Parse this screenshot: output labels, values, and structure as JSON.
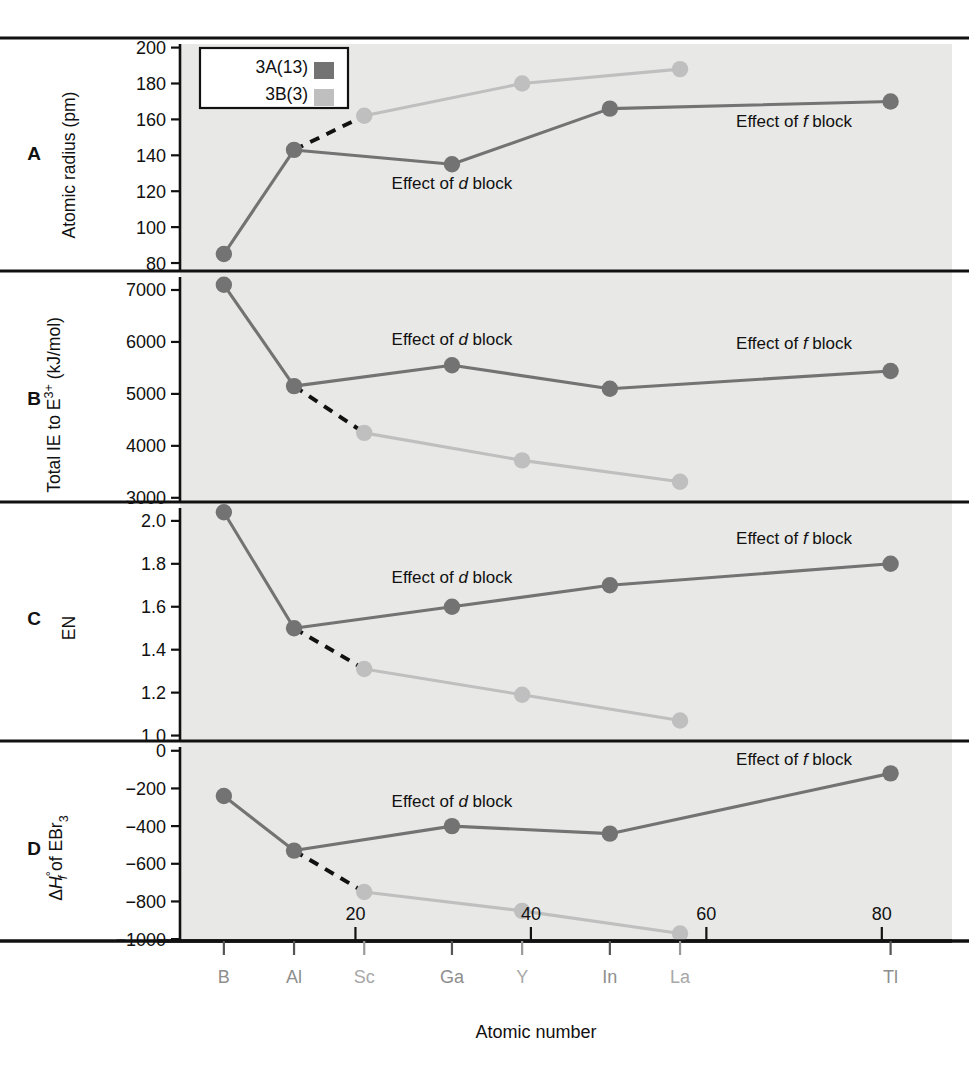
{
  "figure": {
    "xlabel": "Atomic number",
    "legend": {
      "entries": [
        {
          "label": "3A(13)",
          "color": "#737373"
        },
        {
          "label": "3B(3)",
          "color": "#bfbfbf"
        }
      ]
    },
    "element_labels": [
      {
        "symbol": "B",
        "z": 5,
        "group": "3A(13)"
      },
      {
        "symbol": "Al",
        "z": 13,
        "group": "3A(13)"
      },
      {
        "symbol": "Sc",
        "z": 21,
        "group": "3B(3)"
      },
      {
        "symbol": "Ga",
        "z": 31,
        "group": "3A(13)"
      },
      {
        "symbol": "Y",
        "z": 39,
        "group": "3B(3)"
      },
      {
        "symbol": "In",
        "z": 49,
        "group": "3A(13)"
      },
      {
        "symbol": "La",
        "z": 57,
        "group": "3B(3)"
      },
      {
        "symbol": "Tl",
        "z": 81,
        "group": "3A(13)"
      }
    ],
    "x_ticks": [
      20,
      40,
      60,
      80
    ],
    "annotations": {
      "d_block": "Effect of d block",
      "f_block": "Effect of f block",
      "effect_of": "Effect of ",
      "block": " block",
      "d": "d",
      "f": "f"
    },
    "colors": {
      "series_3A": "#737373",
      "series_3B": "#bfbfbf",
      "bridge_dashed": "#111111",
      "plot_background": "#e8e8e6",
      "axis": "#111111"
    }
  },
  "chart_data": [
    {
      "type": "line",
      "panel": "A",
      "title": "",
      "ylabel": "Atomic radius (pm)",
      "xlabel": "Atomic number",
      "ylim": [
        75,
        202
      ],
      "yticks": [
        80,
        100,
        120,
        140,
        160,
        180,
        200
      ],
      "ytick_labels": [
        "80",
        "100",
        "120",
        "140",
        "160",
        "180",
        "200"
      ],
      "xlim": [
        0,
        88
      ],
      "grid": false,
      "legend_position": "top-left",
      "series": [
        {
          "name": "3A(13)",
          "color": "#737373",
          "x": [
            5,
            13,
            31,
            49,
            81
          ],
          "elements": [
            "B",
            "Al",
            "Ga",
            "In",
            "Tl"
          ],
          "values": [
            85,
            143,
            135,
            166,
            170
          ]
        },
        {
          "name": "3B(3)",
          "color": "#bfbfbf",
          "x": [
            21,
            39,
            57
          ],
          "elements": [
            "Sc",
            "Y",
            "La"
          ],
          "values": [
            162,
            180,
            188
          ]
        }
      ],
      "bridge": {
        "from": [
          13,
          143
        ],
        "to": [
          21,
          162
        ],
        "style": "dashed"
      },
      "annotations": [
        {
          "text": "Effect of d block",
          "x": 31,
          "y": 121
        },
        {
          "text": "Effect of f block",
          "x": 70,
          "y": 156
        }
      ]
    },
    {
      "type": "line",
      "panel": "B",
      "title": "",
      "ylabel": "Total IE to E3+ (kJ/mol)",
      "xlabel": "Atomic number",
      "ylim": [
        2900,
        7250
      ],
      "yticks": [
        3000,
        4000,
        5000,
        6000,
        7000
      ],
      "ytick_labels": [
        "3000",
        "4000",
        "5000",
        "6000",
        "7000"
      ],
      "xlim": [
        0,
        88
      ],
      "grid": false,
      "series": [
        {
          "name": "3A(13)",
          "color": "#737373",
          "x": [
            5,
            13,
            31,
            49,
            81
          ],
          "elements": [
            "B",
            "Al",
            "Ga",
            "In",
            "Tl"
          ],
          "values": [
            7100,
            5150,
            5550,
            5100,
            5440
          ]
        },
        {
          "name": "3B(3)",
          "color": "#bfbfbf",
          "x": [
            21,
            39,
            57
          ],
          "elements": [
            "Sc",
            "Y",
            "La"
          ],
          "values": [
            4250,
            3720,
            3310
          ]
        }
      ],
      "bridge": {
        "from": [
          13,
          5150
        ],
        "to": [
          21,
          4250
        ],
        "style": "dashed"
      },
      "annotations": [
        {
          "text": "Effect of d block",
          "x": 31,
          "y": 5940
        },
        {
          "text": "Effect of f block",
          "x": 70,
          "y": 5860
        }
      ]
    },
    {
      "type": "line",
      "panel": "C",
      "title": "",
      "ylabel": "EN",
      "xlabel": "Atomic number",
      "ylim": [
        0.97,
        2.06
      ],
      "yticks": [
        1.0,
        1.2,
        1.4,
        1.6,
        1.8,
        2.0
      ],
      "ytick_labels": [
        "1.0",
        "1.2",
        "1.4",
        "1.6",
        "1.8",
        "2.0"
      ],
      "xlim": [
        0,
        88
      ],
      "grid": false,
      "series": [
        {
          "name": "3A(13)",
          "color": "#737373",
          "x": [
            5,
            13,
            31,
            49,
            81
          ],
          "elements": [
            "B",
            "Al",
            "Ga",
            "In",
            "Tl"
          ],
          "values": [
            2.04,
            1.5,
            1.6,
            1.7,
            1.8
          ]
        },
        {
          "name": "3B(3)",
          "color": "#bfbfbf",
          "x": [
            21,
            39,
            57
          ],
          "elements": [
            "Sc",
            "Y",
            "La"
          ],
          "values": [
            1.31,
            1.19,
            1.07
          ]
        }
      ],
      "bridge": {
        "from": [
          13,
          1.5
        ],
        "to": [
          21,
          1.31
        ],
        "style": "dashed"
      },
      "annotations": [
        {
          "text": "Effect of d block",
          "x": 31,
          "y": 1.71
        },
        {
          "text": "Effect of f block",
          "x": 70,
          "y": 1.89
        }
      ]
    },
    {
      "type": "line",
      "panel": "D",
      "title": "",
      "ylabel": "dHf of EBr3",
      "xlabel": "Atomic number",
      "ylim": [
        -1010,
        20
      ],
      "yticks": [
        -1000,
        -800,
        -600,
        -400,
        -200,
        0
      ],
      "ytick_labels": [
        "-1000",
        "-800",
        "-600",
        "-400",
        "-200",
        "0"
      ],
      "xlim": [
        0,
        88
      ],
      "grid": false,
      "series": [
        {
          "name": "3A(13)",
          "color": "#737373",
          "x": [
            5,
            13,
            31,
            49,
            81
          ],
          "elements": [
            "B",
            "Al",
            "Ga",
            "In",
            "Tl"
          ],
          "values": [
            -240,
            -530,
            -400,
            -440,
            -120
          ]
        },
        {
          "name": "3B(3)",
          "color": "#bfbfbf",
          "x": [
            21,
            39,
            57
          ],
          "elements": [
            "Sc",
            "Y",
            "La"
          ],
          "values": [
            -750,
            -850,
            -970
          ]
        }
      ],
      "bridge": {
        "from": [
          13,
          -530
        ],
        "to": [
          21,
          -750
        ],
        "style": "dashed"
      },
      "annotations": [
        {
          "text": "Effect of d block",
          "x": 31,
          "y": -300
        },
        {
          "text": "Effect of f block",
          "x": 70,
          "y": -75
        }
      ]
    }
  ]
}
